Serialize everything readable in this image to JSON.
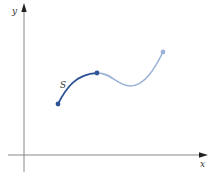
{
  "diagram": {
    "axes": {
      "x_label": "x",
      "y_label": "y",
      "axis_color": "#7a7a7a",
      "arrow_color": "#222222"
    },
    "curve": {
      "segment_label": "S",
      "highlighted_color": "#2f5496",
      "continuation_color": "#9bb3d6",
      "points": {
        "start": [
          58,
          104
        ],
        "junction": [
          97,
          73
        ],
        "end": [
          163,
          52
        ]
      }
    }
  }
}
